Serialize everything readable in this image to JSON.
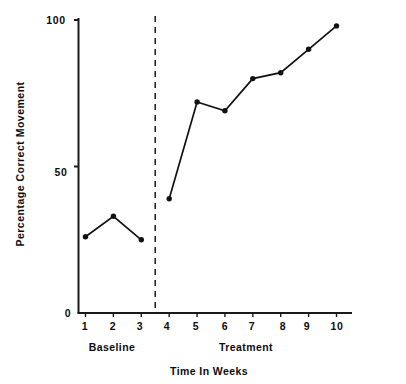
{
  "chart_data": {
    "type": "line",
    "title": "",
    "subtitle": "",
    "xlabel": "Time In Weeks",
    "ylabel": "Percentage Correct Movement",
    "x": [
      1,
      2,
      3,
      4,
      5,
      6,
      7,
      8,
      9,
      10
    ],
    "categories": [
      "1",
      "2",
      "3",
      "4",
      "5",
      "6",
      "7",
      "8",
      "9",
      "10"
    ],
    "series": [
      {
        "name": "Percentage Correct Movement",
        "values": [
          26,
          33,
          25,
          39,
          72,
          69,
          80,
          82,
          90,
          98
        ]
      }
    ],
    "xlim": [
      0.4,
      10.6
    ],
    "ylim": [
      0,
      104
    ],
    "ytick_values": [
      0,
      50,
      100
    ],
    "ytick_labels": [
      "0",
      "50",
      "100"
    ],
    "xtick_labels": [
      "1",
      "2",
      "3",
      "4",
      "5",
      "6",
      "7",
      "8",
      "9",
      "10"
    ],
    "grid": false,
    "legend": "none",
    "marker": "filled-circle",
    "line_color": "#111111",
    "marker_color": "#111111",
    "axis_color": "#1a1a1a",
    "background": "#ffffff",
    "phase_change_line": {
      "style": "dashed",
      "x": 3.5,
      "color": "#1a1a1a"
    },
    "phases": [
      {
        "label": "Baseline",
        "x_start": 1,
        "x_end": 3,
        "center_x": 2
      },
      {
        "label": "Treatment",
        "x_start": 4,
        "x_end": 10,
        "center_x": 7
      }
    ],
    "annotations": [
      {
        "text": "Baseline",
        "kind": "phase-label"
      },
      {
        "text": "Treatment",
        "kind": "phase-label"
      }
    ]
  }
}
